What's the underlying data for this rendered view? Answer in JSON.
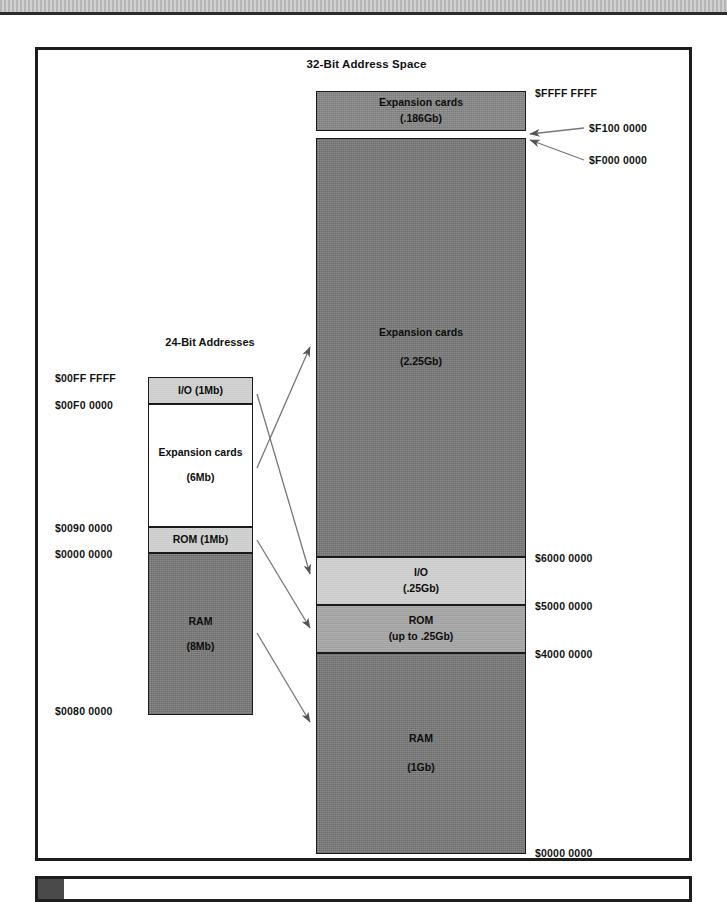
{
  "figure": {
    "title": "32-Bit Address Space",
    "left_column_title": "24-Bit Addresses"
  },
  "left_column": {
    "blocks": [
      {
        "name": "io",
        "label": "I/O (1Mb)",
        "size": ""
      },
      {
        "name": "expansion",
        "label": "Expansion cards",
        "size": "(6Mb)"
      },
      {
        "name": "rom",
        "label": "ROM (1Mb)",
        "size": ""
      },
      {
        "name": "ram",
        "label": "RAM",
        "size": "(8Mb)"
      }
    ],
    "addresses": [
      "$00FF FFFF",
      "$00F0 0000",
      "$0090 0000",
      "$0000 0000",
      "$0080 0000"
    ]
  },
  "right_column": {
    "blocks": [
      {
        "name": "expansion-top",
        "label": "Expansion cards",
        "size": "(.186Gb)"
      },
      {
        "name": "expansion-main",
        "label": "Expansion cards",
        "size": "(2.25Gb)"
      },
      {
        "name": "io",
        "label": "I/O",
        "size": "(.25Gb)"
      },
      {
        "name": "rom",
        "label": "ROM",
        "size": "(up to .25Gb)"
      },
      {
        "name": "ram",
        "label": "RAM",
        "size": "(1Gb)"
      }
    ],
    "addresses": [
      "$FFFF FFFF",
      "$F100 0000",
      "$F000 0000",
      "$6000 0000",
      "$5000 0000",
      "$4000 0000",
      "$0000 0000"
    ]
  }
}
